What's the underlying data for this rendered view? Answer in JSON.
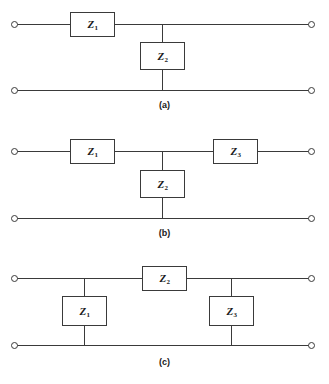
{
  "figure": {
    "type": "circuit-diagram",
    "line_color": "#3a3a3a",
    "background_color": "#ffffff",
    "label_color": "#1a1a1a"
  },
  "circuits": [
    {
      "id": "a",
      "caption": "(a)",
      "topology": "L-section",
      "series_top": [
        {
          "label": "Z",
          "sub": "1"
        }
      ],
      "shunt": [
        {
          "label": "Z",
          "sub": "2"
        }
      ],
      "terminals": 4
    },
    {
      "id": "b",
      "caption": "(b)",
      "topology": "T-section",
      "series_top": [
        {
          "label": "Z",
          "sub": "1"
        },
        {
          "label": "Z",
          "sub": "3"
        }
      ],
      "shunt": [
        {
          "label": "Z",
          "sub": "2"
        }
      ],
      "terminals": 4
    },
    {
      "id": "c",
      "caption": "(c)",
      "topology": "Pi-section",
      "series_top": [
        {
          "label": "Z",
          "sub": "2"
        }
      ],
      "shunt": [
        {
          "label": "Z",
          "sub": "1"
        },
        {
          "label": "Z",
          "sub": "3"
        }
      ],
      "terminals": 4
    }
  ],
  "labels": {
    "z1": "Z",
    "z1_sub": "1",
    "z2": "Z",
    "z2_sub": "2",
    "z3": "Z",
    "z3_sub": "3",
    "caption_a": "(a)",
    "caption_b": "(b)",
    "caption_c": "(c)"
  }
}
